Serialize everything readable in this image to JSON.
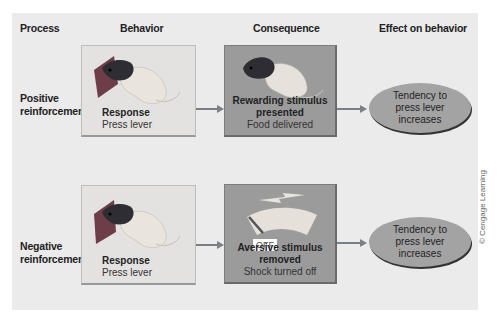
{
  "headers": {
    "process": "Process",
    "behavior": "Behavior",
    "consequence": "Consequence",
    "effect": "Effect on behavior"
  },
  "rows": [
    {
      "process": "Positive reinforcement",
      "behavior": {
        "title": "Response",
        "detail": "Press lever",
        "image": "rat-pressing-lever"
      },
      "consequence": {
        "title": "Rewarding stimulus presented",
        "detail": "Food delivered",
        "image": "rat-eating"
      },
      "effect": "Tendency to press lever increases"
    },
    {
      "process": "Negative reinforcement",
      "behavior": {
        "title": "Response",
        "detail": "Press lever",
        "image": "rat-pressing-lever"
      },
      "consequence": {
        "title": "Aversive stimulus removed",
        "detail": "Shock turned off",
        "image": "shock-meter-off",
        "switch_label": "OFF"
      },
      "effect": "Tendency to press lever increases"
    }
  ],
  "credit": "© Cengage Learning",
  "colors": {
    "panel": "#ebebeb",
    "behavior_box": "#e3e2e0",
    "consequence_box": "#9b9b9b",
    "effect_ellipse": "#a3a3a3",
    "arrow": "#7a8088"
  }
}
